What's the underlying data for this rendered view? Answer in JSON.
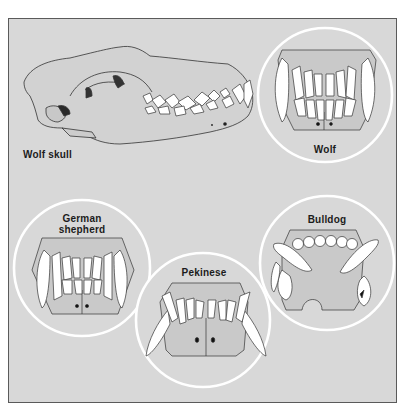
{
  "figure": {
    "background_color": "#d8d8d8",
    "frame_color": "#5a5a5a",
    "circle_color": "#ffffff",
    "tooth_color": "#ffffff"
  },
  "skull": {
    "label": "Wolf skull"
  },
  "circles": [
    {
      "id": "wolf",
      "label": "Wolf",
      "cx": 325,
      "cy": 95,
      "r": 67
    },
    {
      "id": "german-shepherd",
      "label_line1": "German",
      "label_line2": "shepherd",
      "cx": 82,
      "cy": 268,
      "r": 68
    },
    {
      "id": "pekinese",
      "label": "Pekinese",
      "cx": 203,
      "cy": 320,
      "r": 67
    },
    {
      "id": "bulldog",
      "label": "Bulldog",
      "cx": 327,
      "cy": 263,
      "r": 67
    }
  ]
}
